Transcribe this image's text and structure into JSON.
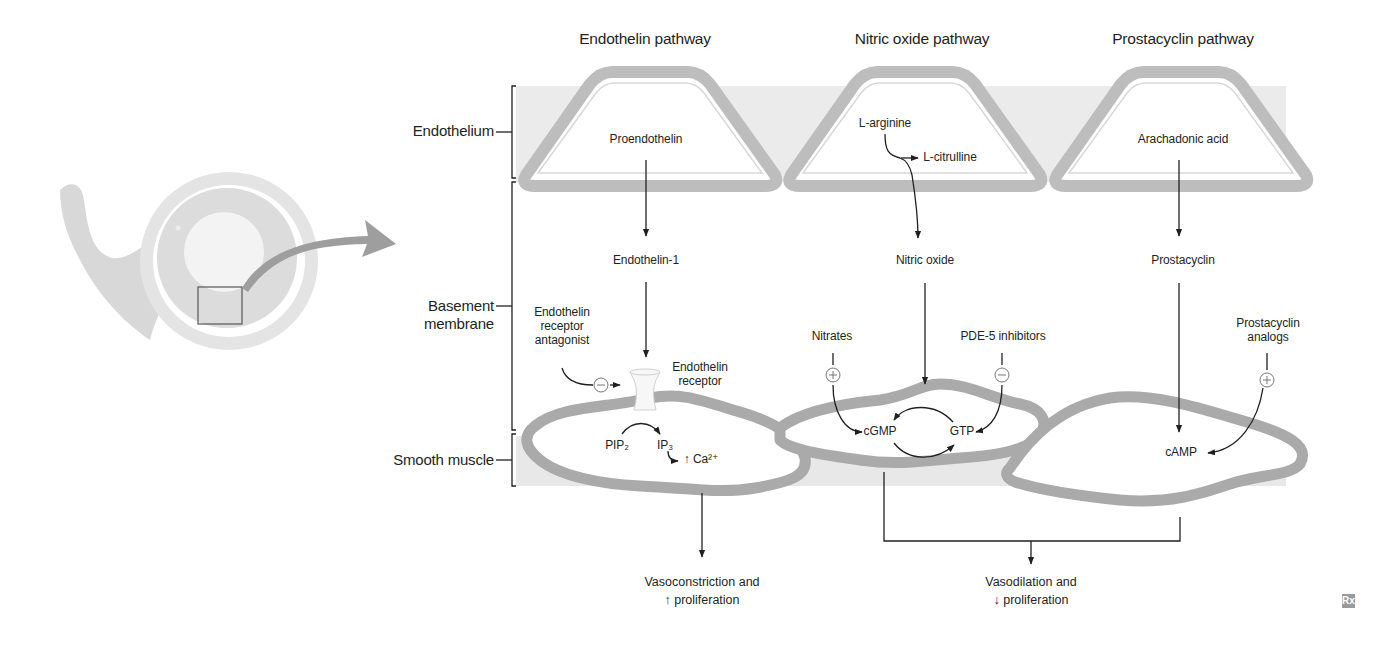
{
  "figure": {
    "pathways": [
      {
        "title": "Endothelin pathway",
        "precursor": "Proendothelin",
        "mediator": "Endothelin-1",
        "receptor": "Endothelin\nreceptor",
        "drug": "Endothelin\nreceptor\nantagonist",
        "drug_effect": "−",
        "second_messenger_from": "PIP₂",
        "second_messenger_to": "IP₃",
        "ion": "↑ Ca²⁺"
      },
      {
        "title": "Nitric oxide pathway",
        "precursor": "L-arginine",
        "byproduct": "L-citrulline",
        "mediator": "Nitric oxide",
        "drug_left": "Nitrates",
        "drug_left_effect": "+",
        "drug_right": "PDE-5 inhibitors",
        "drug_right_effect": "−",
        "messenger_a": "cGMP",
        "messenger_b": "GTP"
      },
      {
        "title": "Prostacyclin pathway",
        "precursor": "Arachadonic acid",
        "mediator": "Prostacyclin",
        "drug": "Prostacyclin\nanalogs",
        "drug_effect": "+",
        "messenger": "cAMP"
      }
    ],
    "layers": [
      {
        "label": "Endothelium"
      },
      {
        "label": "Basement\nmembrane"
      },
      {
        "label": "Smooth muscle"
      }
    ],
    "outcomes": {
      "constriction": "Vasoconstriction and\n↑ proliferation",
      "dilation": "Vasodilation and\n↓ proliferation"
    },
    "logo": "Rx",
    "colors": {
      "band": "#ebebeb",
      "cell_outline": "#b7b7b7",
      "muscle_outline": "#a9a9a9",
      "arrow": "#231f20",
      "vessel_outer": "#e2e2e2",
      "vessel_mid": "#dedede",
      "vessel_inner": "#f0f0f0",
      "callout_arrow": "#9e9e9e"
    }
  }
}
